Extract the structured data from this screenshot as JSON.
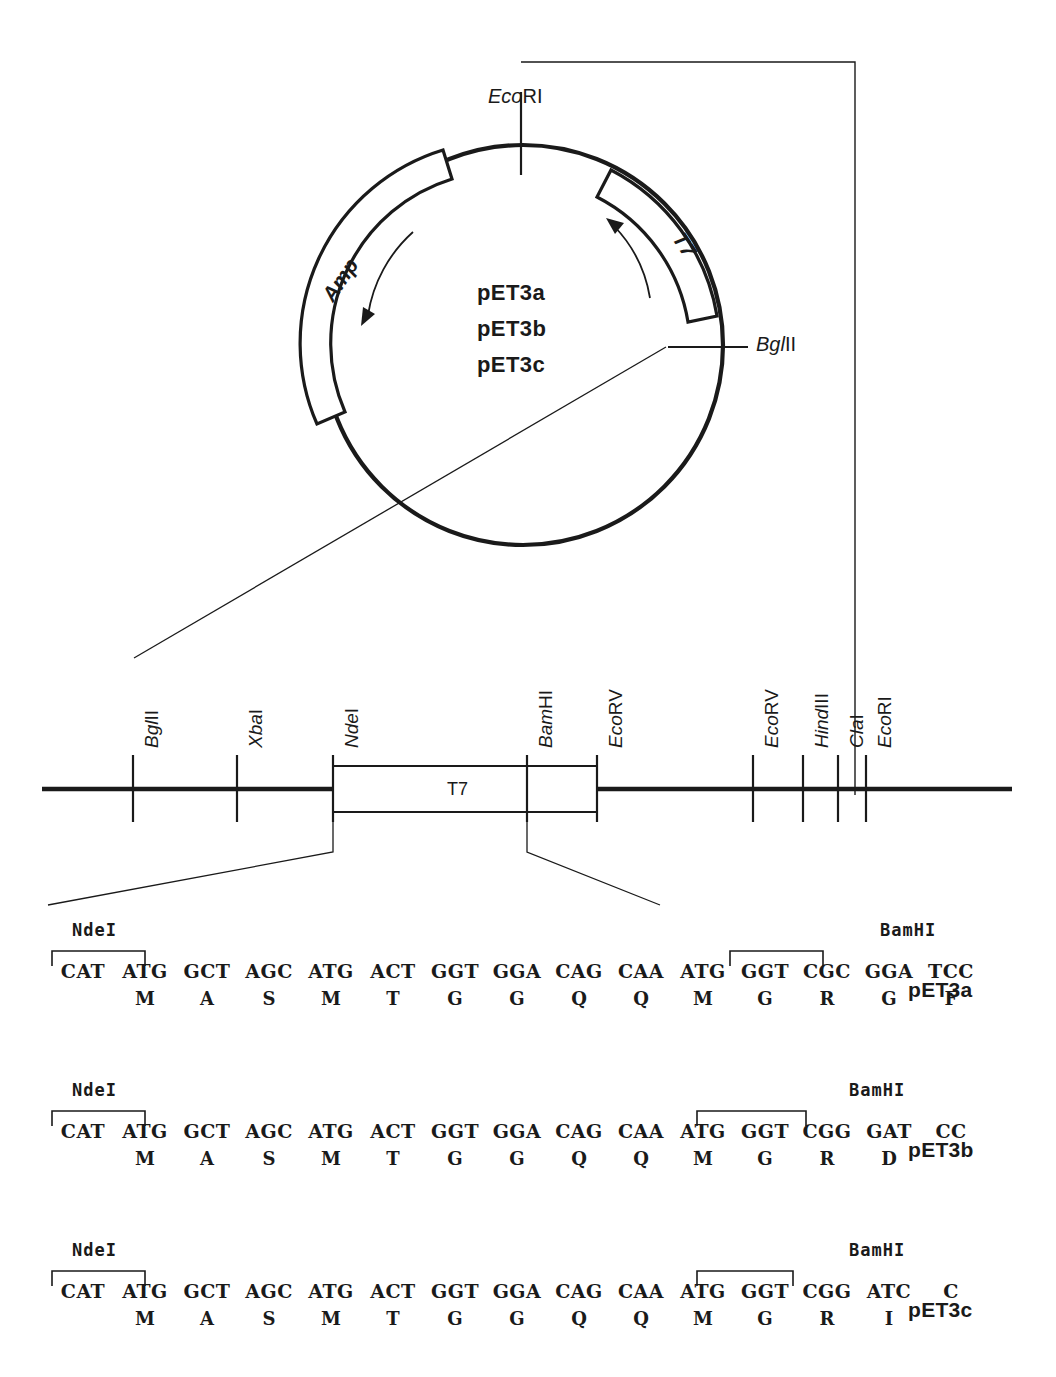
{
  "figure": {
    "kind": "plasmid-map",
    "circular_map": {
      "plasmid_names": [
        "pET3a",
        "pET3b",
        "pET3c"
      ],
      "arcs": [
        {
          "name": "Amp",
          "label": "Amp",
          "direction": "clockwise-arrow-down"
        },
        {
          "name": "T7",
          "label": "T7",
          "direction": "counter-clockwise-arrow-up"
        }
      ],
      "sites": [
        {
          "name": "EcoRI",
          "italic_part": "Eco",
          "roman_part": "RI",
          "position": "top"
        },
        {
          "name": "BglII",
          "italic_part": "Bgl",
          "roman_part": "II",
          "position": "right"
        }
      ]
    },
    "linear_map": {
      "region_label": "T7",
      "sites": [
        {
          "label": "BglII",
          "italic": "Bgl",
          "roman": "II",
          "x": 133
        },
        {
          "label": "XbaI",
          "italic": "Xba",
          "roman": "I",
          "x": 237
        },
        {
          "label": "NdeI",
          "italic": "Nde",
          "roman": "I",
          "x": 333
        },
        {
          "label": "BamHI",
          "italic": "Bam",
          "roman": "HI",
          "x": 527
        },
        {
          "label": "EcoRV",
          "italic": "Eco",
          "roman": "RV",
          "x": 597
        },
        {
          "label": "EcoRV",
          "italic": "Eco",
          "roman": "RV",
          "x": 753
        },
        {
          "label": "HindIII",
          "italic": "Hind",
          "roman": "III",
          "x": 803
        },
        {
          "label": "ClaI",
          "italic": "Cla",
          "roman": "I",
          "x": 838
        },
        {
          "label": "EcoRI",
          "italic": "Eco",
          "roman": "RI",
          "x": 866
        }
      ]
    },
    "sequences": [
      {
        "plasmid": "pET3a",
        "left_site": "NdeI",
        "right_site": "BamHI",
        "left_bracket_codons": [
          0,
          1
        ],
        "right_bracket_codons": [
          13,
          14
        ],
        "codons": [
          "CAT",
          "ATG",
          "GCT",
          "AGC",
          "ATG",
          "ACT",
          "GGT",
          "GGA",
          "CAG",
          "CAA",
          "ATG",
          "GGT",
          "CGC",
          "GGA",
          "TCC"
        ],
        "residues": [
          "",
          "M",
          "A",
          "S",
          "M",
          "T",
          "G",
          "G",
          "Q",
          "Q",
          "M",
          "G",
          "R",
          "G",
          "F"
        ]
      },
      {
        "plasmid": "pET3b",
        "left_site": "NdeI",
        "right_site": "BamHI",
        "left_bracket_codons": [
          0,
          1
        ],
        "right_bracket_codons": [
          12,
          14
        ],
        "codons": [
          "CAT",
          "ATG",
          "GCT",
          "AGC",
          "ATG",
          "ACT",
          "GGT",
          "GGA",
          "CAG",
          "CAA",
          "ATG",
          "GGT",
          "CGG",
          "GAT",
          "CC"
        ],
        "residues": [
          "",
          "M",
          "A",
          "S",
          "M",
          "T",
          "G",
          "G",
          "Q",
          "Q",
          "M",
          "G",
          "R",
          "D",
          ""
        ]
      },
      {
        "plasmid": "pET3c",
        "left_site": "NdeI",
        "right_site": "BamHI",
        "left_bracket_codons": [
          0,
          1
        ],
        "right_bracket_codons": [
          12,
          14
        ],
        "codons": [
          "CAT",
          "ATG",
          "GCT",
          "AGC",
          "ATG",
          "ACT",
          "GGT",
          "GGA",
          "CAG",
          "CAA",
          "ATG",
          "GGT",
          "CGG",
          "ATC",
          "C"
        ],
        "residues": [
          "",
          "M",
          "A",
          "S",
          "M",
          "T",
          "G",
          "G",
          "Q",
          "Q",
          "M",
          "G",
          "R",
          "I",
          ""
        ]
      }
    ],
    "colors": {
      "ink": "#1a1a1a",
      "background": "#ffffff"
    }
  }
}
